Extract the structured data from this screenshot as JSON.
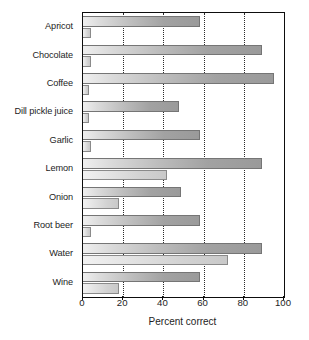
{
  "chart_data": {
    "type": "bar",
    "orientation": "horizontal",
    "title": "",
    "xlabel": "Percent correct",
    "ylabel": "",
    "xlim": [
      0,
      100
    ],
    "xticks": [
      0,
      20,
      40,
      60,
      80,
      100
    ],
    "xtick_labels": [
      "0",
      "20",
      "40",
      "60",
      "80",
      "100"
    ],
    "grid": "vertical-dotted",
    "legend": "none",
    "categories": [
      "Apricot",
      "Chocolate",
      "Coffee",
      "Dill pickle juice",
      "Garlic",
      "Lemon",
      "Onion",
      "Root beer",
      "Water",
      "Wine"
    ],
    "series": [
      {
        "name": "upper-bar",
        "values": [
          58,
          89,
          95,
          48,
          58,
          89,
          49,
          58,
          89,
          58
        ]
      },
      {
        "name": "lower-bar",
        "values": [
          4,
          4,
          3,
          3,
          4,
          42,
          18,
          4,
          72,
          18
        ]
      }
    ]
  },
  "axis": {
    "x_title": "Percent correct"
  }
}
